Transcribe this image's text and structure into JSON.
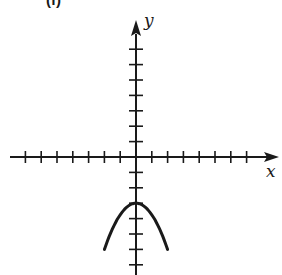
{
  "panel_label": "(f)",
  "chart_data": {
    "type": "line",
    "title": "",
    "xlabel": "x",
    "ylabel": "y",
    "grid": false,
    "legend": null,
    "x_ticks": [
      -7,
      -6,
      -5,
      -4,
      -3,
      -2,
      -1,
      1,
      2,
      3,
      4,
      5,
      6,
      7
    ],
    "y_ticks": [
      -7,
      -6,
      -5,
      -4,
      -3,
      -2,
      -1,
      1,
      2,
      3,
      4,
      5,
      6,
      7
    ],
    "xlim": [
      -8,
      9
    ],
    "ylim": [
      -7.5,
      8.8
    ],
    "series": [
      {
        "name": "downward parabola",
        "description": "y = -3 - 0.75x^2, vertex at (0,-3)",
        "x": [
          -2,
          -1.5,
          -1,
          -0.5,
          0,
          0.5,
          1,
          1.5,
          2
        ],
        "y": [
          -6,
          -4.69,
          -3.75,
          -3.19,
          -3,
          -3.19,
          -3.75,
          -4.69,
          -6
        ]
      }
    ],
    "colors": {
      "axis": "#1a1a1a",
      "curve": "#1a1a1a"
    }
  }
}
